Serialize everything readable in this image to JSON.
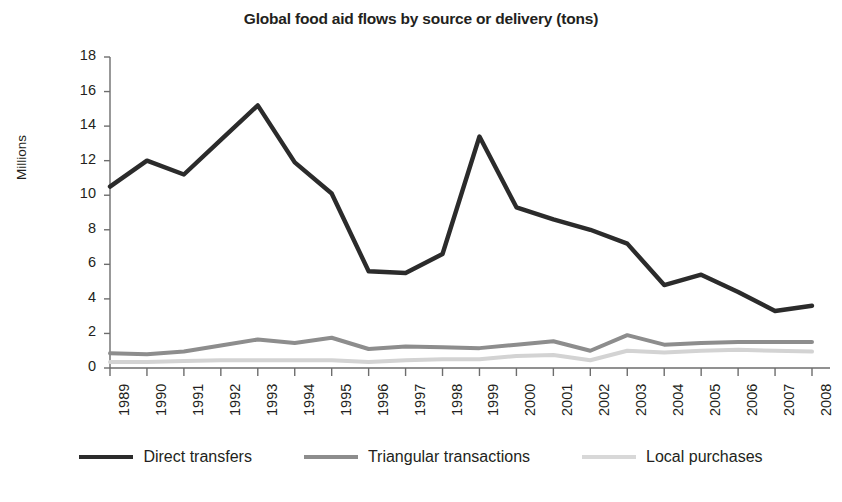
{
  "chart_data": {
    "type": "line",
    "title": "Global food aid flows by source or delivery (tons)",
    "xlabel": "",
    "ylabel": "Millions",
    "ylim": [
      0,
      18
    ],
    "ytick_step": 2,
    "yticks": [
      "0",
      "2",
      "4",
      "6",
      "8",
      "10",
      "12",
      "14",
      "16",
      "18"
    ],
    "grid": false,
    "legend_position": "bottom",
    "categories": [
      "1989",
      "1990",
      "1991",
      "1992",
      "1993",
      "1994",
      "1995",
      "1996",
      "1997",
      "1998",
      "1999",
      "2000",
      "2001",
      "2002",
      "2003",
      "2004",
      "2005",
      "2006",
      "2007",
      "2008"
    ],
    "series": [
      {
        "name": "Direct transfers",
        "color": "#2b2b2b",
        "values": [
          10.5,
          12.0,
          11.2,
          13.2,
          15.2,
          11.9,
          10.1,
          5.6,
          5.5,
          6.6,
          13.4,
          9.3,
          8.6,
          8.0,
          7.2,
          4.8,
          5.4,
          4.4,
          3.3,
          3.6
        ]
      },
      {
        "name": "Triangular transactions",
        "color": "#8d8d8d",
        "values": [
          0.85,
          0.8,
          0.95,
          1.3,
          1.65,
          1.45,
          1.75,
          1.1,
          1.25,
          1.2,
          1.15,
          1.35,
          1.55,
          1.0,
          1.9,
          1.35,
          1.45,
          1.5,
          1.5,
          1.5
        ]
      },
      {
        "name": "Local purchases",
        "color": "#d3d3d3",
        "values": [
          0.35,
          0.35,
          0.4,
          0.45,
          0.45,
          0.45,
          0.45,
          0.35,
          0.45,
          0.5,
          0.5,
          0.7,
          0.75,
          0.45,
          1.0,
          0.9,
          1.0,
          1.05,
          1.0,
          0.95
        ]
      }
    ]
  },
  "legend": {
    "items": [
      {
        "label": "Direct transfers",
        "color": "#2b2b2b",
        "width": 4
      },
      {
        "label": "Triangular transactions",
        "color": "#8d8d8d",
        "width": 4
      },
      {
        "label": "Local purchases",
        "color": "#d8d8d8",
        "width": 4
      }
    ]
  },
  "axis": {
    "color": "#6d6d6d",
    "tick_color": "#6d6d6d"
  }
}
